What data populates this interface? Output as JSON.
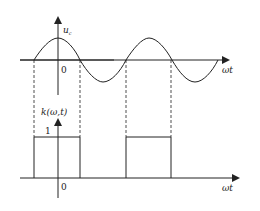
{
  "top_plot": {
    "y_label": "u",
    "y_label_sub": "c",
    "x_label": "ωt",
    "origin_label": "0",
    "signal": "sinusoid (cosine starting at peak at origin)"
  },
  "bottom_plot": {
    "y_label": "k(ω,t)",
    "x_label": "ωt",
    "origin_label": "0",
    "level_label": "1",
    "signal": "square pulse train, 1 during positive half-cycles of u_c, 0 otherwise"
  },
  "colors": {
    "line": "#222222",
    "background": "#ffffff"
  }
}
